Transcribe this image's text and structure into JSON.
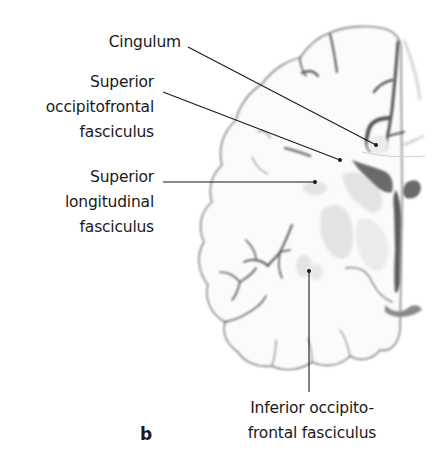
{
  "figure": {
    "panel_letter": "b",
    "colors": {
      "outline": "#6f6f6f",
      "sulci": "#5a5a5a",
      "white_matter": "#fbfbfb",
      "gray_nuclei": "#e2e2e2",
      "ventricle": "#6a6a6a",
      "leader_line": "#1a1a1a",
      "text": "#1a1a1a"
    },
    "labels": [
      {
        "id": "cingulum",
        "lines": [
          "Cingulum"
        ]
      },
      {
        "id": "superior-occipitofrontal-fasciculus",
        "lines": [
          "Superior",
          "occipitofrontal",
          "fasciculus"
        ]
      },
      {
        "id": "superior-longitudinal-fasciculus",
        "lines": [
          "Superior",
          "longitudinal",
          "fasciculus"
        ]
      },
      {
        "id": "inferior-occipitofrontal-fasciculus",
        "lines": [
          "Inferior occipito-",
          "frontal fasciculus"
        ]
      }
    ]
  }
}
